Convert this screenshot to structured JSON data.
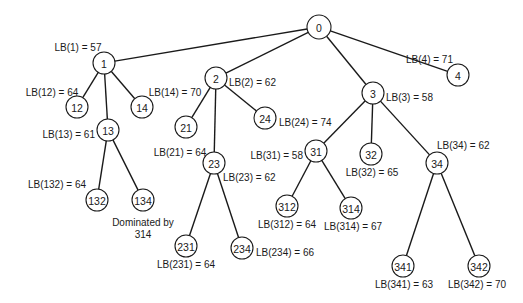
{
  "diagram": {
    "type": "branch-and-bound-tree",
    "colors": {
      "line": "#1a1a1a",
      "background": "#ffffff"
    },
    "nodes": [
      {
        "id": "0",
        "x": 319,
        "y": 27,
        "r": 12
      },
      {
        "id": "1",
        "x": 104,
        "y": 63,
        "r": 11,
        "label": "LB(1) = 57",
        "lx": 78,
        "ly": 47,
        "anchor": "middle"
      },
      {
        "id": "2",
        "x": 216,
        "y": 78,
        "r": 11,
        "label": "LB(2) = 62",
        "lx": 229,
        "ly": 82,
        "anchor": "start"
      },
      {
        "id": "3",
        "x": 373,
        "y": 93,
        "r": 11,
        "label": "LB(3) = 58",
        "lx": 386,
        "ly": 97,
        "anchor": "start"
      },
      {
        "id": "4",
        "x": 458,
        "y": 75,
        "r": 11,
        "label": "LB(4) = 71",
        "lx": 453,
        "ly": 59,
        "anchor": "end"
      },
      {
        "id": "12",
        "x": 77,
        "y": 107,
        "r": 11,
        "label": "LB(12) = 64",
        "lx": 52,
        "ly": 92,
        "anchor": "middle"
      },
      {
        "id": "13",
        "x": 108,
        "y": 130,
        "r": 11,
        "label": "LB(13) = 61",
        "lx": 95,
        "ly": 134,
        "anchor": "end"
      },
      {
        "id": "14",
        "x": 142,
        "y": 107,
        "r": 11,
        "label": "LB(14) = 70",
        "lx": 175,
        "ly": 92,
        "anchor": "middle"
      },
      {
        "id": "21",
        "x": 186,
        "y": 127,
        "r": 11,
        "label": "LB(21) = 64",
        "lx": 180,
        "ly": 152,
        "anchor": "middle"
      },
      {
        "id": "23",
        "x": 214,
        "y": 163,
        "r": 11,
        "label": "LB(23) = 62",
        "lx": 223,
        "ly": 177,
        "anchor": "start"
      },
      {
        "id": "24",
        "x": 265,
        "y": 118,
        "r": 11,
        "label": "LB(24) = 74",
        "lx": 279,
        "ly": 122,
        "anchor": "start"
      },
      {
        "id": "31",
        "x": 316,
        "y": 151,
        "r": 11,
        "label": "LB(31) = 58",
        "lx": 303,
        "ly": 155,
        "anchor": "end"
      },
      {
        "id": "32",
        "x": 371,
        "y": 154,
        "r": 11,
        "label": "LB(32) = 65",
        "lx": 372,
        "ly": 172,
        "anchor": "middle"
      },
      {
        "id": "34",
        "x": 437,
        "y": 163,
        "r": 11,
        "label": "LB(34) = 62",
        "lx": 437,
        "ly": 145,
        "anchor": "start"
      },
      {
        "id": "132",
        "x": 97,
        "y": 200,
        "r": 11,
        "label": "LB(132) = 64",
        "lx": 57,
        "ly": 184,
        "anchor": "middle"
      },
      {
        "id": "134",
        "x": 143,
        "y": 200,
        "r": 11,
        "label": "Dominated by",
        "lx": 143,
        "ly": 222,
        "anchor": "middle",
        "label2": "314",
        "lx2": 143,
        "ly2": 234
      },
      {
        "id": "231",
        "x": 186,
        "y": 246,
        "r": 11,
        "label": "LB(231) = 64",
        "lx": 186,
        "ly": 264,
        "anchor": "middle"
      },
      {
        "id": "234",
        "x": 242,
        "y": 248,
        "r": 11,
        "label": "LB(234) = 66",
        "lx": 256,
        "ly": 252,
        "anchor": "start"
      },
      {
        "id": "312",
        "x": 287,
        "y": 206,
        "r": 11,
        "label": "LB(312) = 64",
        "lx": 287,
        "ly": 224,
        "anchor": "middle"
      },
      {
        "id": "314",
        "x": 351,
        "y": 208,
        "r": 11,
        "label": "LB(314) = 67",
        "lx": 353,
        "ly": 226,
        "anchor": "middle"
      },
      {
        "id": "341",
        "x": 403,
        "y": 266,
        "r": 11,
        "label": "LB(341) = 63",
        "lx": 404,
        "ly": 284,
        "anchor": "middle"
      },
      {
        "id": "342",
        "x": 479,
        "y": 266,
        "r": 11,
        "label": "LB(342) = 70",
        "lx": 477,
        "ly": 284,
        "anchor": "middle"
      }
    ],
    "edges": [
      [
        "0",
        "1"
      ],
      [
        "0",
        "2"
      ],
      [
        "0",
        "3"
      ],
      [
        "0",
        "4"
      ],
      [
        "1",
        "12"
      ],
      [
        "1",
        "13"
      ],
      [
        "1",
        "14"
      ],
      [
        "13",
        "132"
      ],
      [
        "13",
        "134"
      ],
      [
        "2",
        "21"
      ],
      [
        "2",
        "23"
      ],
      [
        "2",
        "24"
      ],
      [
        "23",
        "231"
      ],
      [
        "23",
        "234"
      ],
      [
        "3",
        "31"
      ],
      [
        "3",
        "32"
      ],
      [
        "3",
        "34"
      ],
      [
        "31",
        "312"
      ],
      [
        "31",
        "314"
      ],
      [
        "34",
        "341"
      ],
      [
        "34",
        "342"
      ]
    ]
  }
}
